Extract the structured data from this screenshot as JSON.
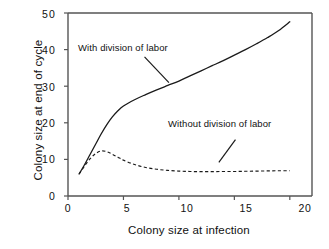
{
  "figure": {
    "background_color": "#ffffff",
    "axis_color": "#4a4a4a",
    "curve_color": "#1a1a1a"
  },
  "chart_data": {
    "type": "line",
    "title": "",
    "xlabel": "Colony size at infection",
    "ylabel": "Colony size at end of cycle",
    "xlim": [
      0,
      22
    ],
    "ylim": [
      0,
      50
    ],
    "xticks": [
      0,
      5,
      10,
      15,
      20
    ],
    "yticks": [
      0,
      10,
      20,
      30,
      40,
      50
    ],
    "xtick_labels": [
      "0",
      "5",
      "10",
      "15",
      "20"
    ],
    "ytick_labels": [
      "0",
      "10",
      "20",
      "30",
      "40",
      "50"
    ],
    "grid": false,
    "legend": "annotations-inline",
    "series": [
      {
        "name": "With division of labor",
        "style": "solid",
        "color": "#1a1a1a",
        "x": [
          1,
          1.5,
          2,
          2.5,
          3,
          3.5,
          4,
          4.5,
          5,
          6,
          7,
          8,
          9,
          10,
          11,
          12,
          13,
          14,
          15,
          16,
          17,
          18,
          19,
          20
        ],
        "y": [
          6.0,
          8.6,
          11.4,
          14.2,
          17.0,
          19.5,
          21.6,
          23.3,
          24.6,
          26.3,
          27.7,
          29.0,
          30.2,
          31.4,
          32.8,
          34.2,
          35.6,
          37.0,
          38.5,
          40.0,
          41.6,
          43.3,
          45.2,
          47.6
        ]
      },
      {
        "name": "Without division of labor",
        "style": "dashed",
        "color": "#1a1a1a",
        "x": [
          1,
          1.5,
          2,
          2.5,
          3,
          3.5,
          4,
          4.5,
          5,
          6,
          7,
          8,
          9,
          10,
          11,
          12,
          13,
          14,
          15,
          16,
          17,
          18,
          19,
          20
        ],
        "y": [
          6.0,
          8.2,
          10.2,
          11.6,
          12.3,
          12.1,
          11.4,
          10.6,
          9.8,
          8.6,
          7.8,
          7.3,
          7.0,
          6.8,
          6.7,
          6.65,
          6.65,
          6.7,
          6.7,
          6.75,
          6.8,
          6.85,
          6.9,
          6.9
        ]
      }
    ],
    "annotations": [
      {
        "text": "With division of labor",
        "pointer_from": [
          6.9,
          38.0
        ],
        "pointer_to": [
          9.1,
          31.0
        ]
      },
      {
        "text": "Without division of labor",
        "pointer_from": [
          15.1,
          15.4
        ],
        "pointer_to": [
          13.6,
          9.2
        ]
      }
    ]
  }
}
